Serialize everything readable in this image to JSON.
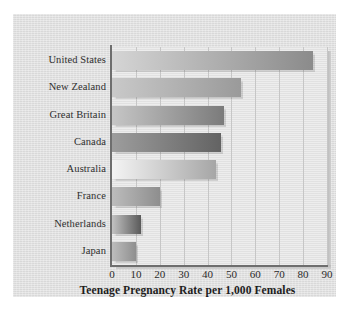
{
  "chart_data": {
    "type": "bar",
    "orientation": "horizontal",
    "title": "",
    "xlabel": "Teenage Pregnancy Rate per 1,000 Females",
    "ylabel": "",
    "xlim": [
      0,
      90
    ],
    "xticks": [
      "0",
      "10",
      "20",
      "30",
      "40",
      "50",
      "60",
      "70",
      "80",
      "90"
    ],
    "grid": "vertical",
    "legend": "none",
    "categories": [
      "United States",
      "New Zealand",
      "Great Britain",
      "Canada",
      "Australia",
      "France",
      "Netherlands",
      "Japan"
    ],
    "values": [
      84,
      54,
      47,
      45.5,
      43.5,
      20,
      12,
      10
    ],
    "bar_colors": [
      {
        "from": "#d5d5d5",
        "to": "#8b8b8b"
      },
      {
        "from": "#c9c9c9",
        "to": "#9a9a9a"
      },
      {
        "from": "#c6c6c6",
        "to": "#7b7b7b"
      },
      {
        "from": "#9d9d9d",
        "to": "#636363"
      },
      {
        "from": "#f4f4f4",
        "to": "#a6a6a6"
      },
      {
        "from": "#bcbcbc",
        "to": "#8e8e8e"
      },
      {
        "from": "#c2c2c2",
        "to": "#5a5a5a"
      },
      {
        "from": "#bdbdbd",
        "to": "#8f8f8f"
      }
    ]
  },
  "figure": {
    "panel_color": "#dedede",
    "plot_color": "#e4e4e4",
    "axis_color": "#6e6e6e",
    "gridline_color": "#c6c6c6"
  }
}
